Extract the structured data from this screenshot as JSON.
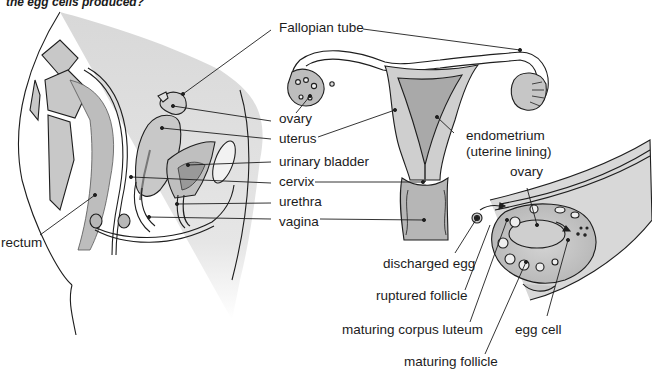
{
  "question": "the egg cells produced?",
  "colors": {
    "line": "#1e1e1e",
    "body_fill": "#dcdcdc",
    "organ_fill": "#c9c9c9",
    "dark_fill": "#a8a8a8",
    "text": "#1c1c1c"
  },
  "left_diagram": {
    "title": "side view of female pelvis",
    "labels": {
      "fallopian_tube": "Fallopian tube",
      "ovary": "ovary",
      "uterus": "uterus",
      "urinary_bladder": "urinary bladder",
      "cervix": "cervix",
      "urethra": "urethra",
      "vagina": "vagina",
      "rectum": "rectum"
    }
  },
  "front_diagram": {
    "labels": {
      "endometrium": "endometrium",
      "endometrium_sub": "(uterine lining)"
    }
  },
  "ovary_diagram": {
    "labels": {
      "ovary": "ovary",
      "discharged_egg": "discharged egg",
      "ruptured_follicle": "ruptured follicle",
      "maturing_corpus_luteum": "maturing corpus luteum",
      "egg_cell": "egg cell",
      "maturing_follicle": "maturing follicle"
    }
  }
}
